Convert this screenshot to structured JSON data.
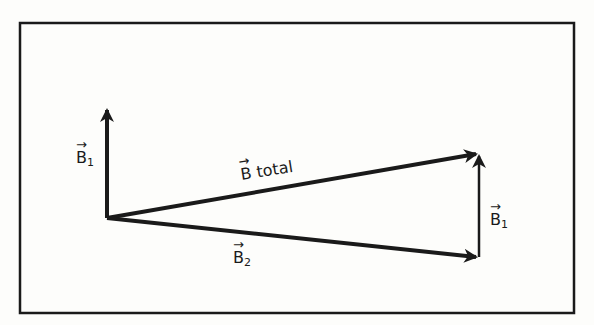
{
  "diagram": {
    "type": "vector-addition",
    "colors": {
      "ink": "#1a1a1a",
      "background": "#fdfdfb"
    },
    "labels": {
      "b1_left": {
        "base": "B",
        "sub": "1",
        "arrow": "→"
      },
      "b_total": {
        "base": "B",
        "text": " total",
        "arrow": "→"
      },
      "b2": {
        "base": "B",
        "sub": "2",
        "arrow": "→"
      },
      "b1_right": {
        "base": "B",
        "sub": "1",
        "arrow": "→"
      }
    }
  }
}
